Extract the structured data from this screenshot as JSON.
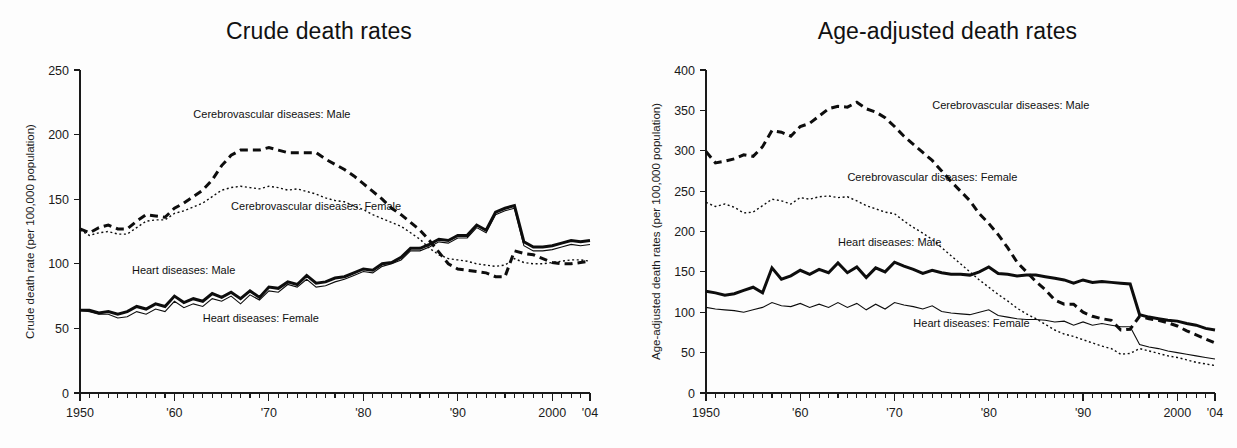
{
  "figure": {
    "background": "#fdfdfd",
    "ink_color": "#0d0d0d"
  },
  "panels": [
    {
      "id": "crude",
      "title": "Crude death rates",
      "ylabel": "Crude death rate (per 100,000 population)",
      "xlabel": "",
      "annotations": [
        {
          "text": "Cerebrovascular diseases: Male",
          "x_year": 1962.0,
          "y_value": 213
        },
        {
          "text": "Cerebrovascular diseases: Female",
          "x_year": 1966.0,
          "y_value": 142
        },
        {
          "text": "Heart diseases: Male",
          "x_year": 1955.5,
          "y_value": 92
        },
        {
          "text": "Heart diseases: Female",
          "x_year": 1963.0,
          "y_value": 55
        }
      ]
    },
    {
      "id": "age-adjusted",
      "title": "Age-adjusted death rates",
      "ylabel": "Age-adjusted death rates (per 100,000 population)",
      "xlabel": "",
      "annotations": [
        {
          "text": "Cerebrovascular diseases: Male",
          "x_year": 1974.0,
          "y_value": 352
        },
        {
          "text": "Cerebrovascular diseases: Female",
          "x_year": 1965.0,
          "y_value": 263
        },
        {
          "text": "Heart diseases: Male",
          "x_year": 1964.0,
          "y_value": 182
        },
        {
          "text": "Heart diseases: Female",
          "x_year": 1972.0,
          "y_value": 82
        }
      ]
    }
  ],
  "chart_data": [
    {
      "type": "line",
      "title": "Crude death rates",
      "xlabel": "",
      "ylabel": "Crude death rate (per 100,000 population)",
      "xlim": [
        1950,
        2004
      ],
      "ylim": [
        0,
        250
      ],
      "ytick_labels": [
        "0",
        "50",
        "100",
        "150",
        "200",
        "250"
      ],
      "yticks": [
        0,
        50,
        100,
        150,
        200,
        250
      ],
      "xticks": [
        1950,
        1960,
        1970,
        1980,
        1990,
        2000,
        2004
      ],
      "xtick_labels": [
        "1950",
        "'60",
        "'70",
        "'80",
        "'90",
        "2000",
        "'04"
      ],
      "minor_xtick_interval": 1,
      "grid": false,
      "legend_position": "inline-annotations",
      "x": [
        1950,
        1951,
        1952,
        1953,
        1954,
        1955,
        1956,
        1957,
        1958,
        1959,
        1960,
        1961,
        1962,
        1963,
        1964,
        1965,
        1966,
        1967,
        1968,
        1969,
        1970,
        1971,
        1972,
        1973,
        1974,
        1975,
        1976,
        1977,
        1978,
        1979,
        1980,
        1981,
        1982,
        1983,
        1984,
        1985,
        1986,
        1987,
        1988,
        1989,
        1990,
        1991,
        1992,
        1993,
        1994,
        1995,
        1996,
        1997,
        1998,
        1999,
        2000,
        2001,
        2002,
        2003,
        2004
      ],
      "series": [
        {
          "name": "Cerebrovascular diseases: Male",
          "style": "thick-dashed",
          "values": [
            127,
            124,
            128,
            130,
            127,
            127,
            133,
            138,
            137,
            136,
            143,
            147,
            152,
            157,
            165,
            176,
            184,
            188,
            188,
            188,
            190,
            188,
            186,
            186,
            186,
            186,
            181,
            177,
            173,
            168,
            162,
            156,
            150,
            143,
            138,
            132,
            126,
            118,
            109,
            100,
            96,
            95,
            94,
            93,
            90,
            90,
            110,
            108,
            107,
            104,
            101,
            100,
            100,
            101,
            102
          ]
        },
        {
          "name": "Cerebrovascular diseases: Female",
          "style": "thin-dotted",
          "values": [
            126,
            122,
            124,
            125,
            123,
            123,
            128,
            133,
            134,
            134,
            139,
            141,
            144,
            147,
            152,
            157,
            159,
            160,
            159,
            158,
            160,
            159,
            157,
            158,
            156,
            154,
            151,
            149,
            148,
            145,
            142,
            138,
            135,
            132,
            129,
            124,
            119,
            112,
            107,
            104,
            103,
            102,
            100,
            99,
            98,
            99,
            104,
            101,
            100,
            100,
            101,
            102,
            103,
            103,
            102
          ]
        },
        {
          "name": "Heart diseases: Male",
          "style": "thick-solid",
          "values": [
            64,
            64,
            62,
            63,
            61,
            63,
            67,
            65,
            69,
            67,
            75,
            70,
            73,
            71,
            77,
            74,
            78,
            73,
            79,
            74,
            82,
            81,
            86,
            84,
            91,
            85,
            86,
            89,
            90,
            93,
            96,
            95,
            100,
            101,
            105,
            112,
            112,
            115,
            119,
            118,
            122,
            122,
            130,
            126,
            140,
            143,
            145,
            117,
            113,
            113,
            114,
            116,
            118,
            117,
            118
          ]
        },
        {
          "name": "Heart diseases: Female",
          "style": "thin-solid",
          "values": [
            64,
            63,
            61,
            61,
            58,
            59,
            63,
            61,
            65,
            63,
            71,
            66,
            69,
            67,
            73,
            71,
            75,
            69,
            76,
            72,
            79,
            78,
            84,
            82,
            88,
            82,
            83,
            86,
            88,
            91,
            94,
            93,
            98,
            100,
            103,
            110,
            110,
            113,
            117,
            116,
            120,
            120,
            128,
            124,
            138,
            141,
            143,
            114,
            110,
            110,
            111,
            113,
            115,
            114,
            115
          ]
        }
      ]
    },
    {
      "type": "line",
      "title": "Age-adjusted death rates",
      "xlabel": "",
      "ylabel": "Age-adjusted death rates (per 100,000 population)",
      "xlim": [
        1950,
        2004
      ],
      "ylim": [
        0,
        400
      ],
      "ytick_labels": [
        "0",
        "50",
        "100",
        "150",
        "200",
        "250",
        "300",
        "350",
        "400"
      ],
      "yticks": [
        0,
        50,
        100,
        150,
        200,
        250,
        300,
        350,
        400
      ],
      "xticks": [
        1950,
        1960,
        1970,
        1980,
        1990,
        2000,
        2004
      ],
      "xtick_labels": [
        "1950",
        "'60",
        "'70",
        "'80",
        "'90",
        "2000",
        "'04"
      ],
      "minor_xtick_interval": 1,
      "grid": false,
      "legend_position": "inline-annotations",
      "x": [
        1950,
        1951,
        1952,
        1953,
        1954,
        1955,
        1956,
        1957,
        1958,
        1959,
        1960,
        1961,
        1962,
        1963,
        1964,
        1965,
        1966,
        1967,
        1968,
        1969,
        1970,
        1971,
        1972,
        1973,
        1974,
        1975,
        1976,
        1977,
        1978,
        1979,
        1980,
        1981,
        1982,
        1983,
        1984,
        1985,
        1986,
        1987,
        1988,
        1989,
        1990,
        1991,
        1992,
        1993,
        1994,
        1995,
        1996,
        1997,
        1998,
        1999,
        2000,
        2001,
        2002,
        2003,
        2004
      ],
      "series": [
        {
          "name": "Cerebrovascular diseases: Male",
          "style": "thick-dashed",
          "values": [
            299,
            285,
            287,
            290,
            295,
            293,
            305,
            325,
            323,
            318,
            330,
            334,
            343,
            352,
            355,
            354,
            360,
            352,
            348,
            341,
            330,
            318,
            308,
            298,
            288,
            275,
            262,
            250,
            238,
            222,
            210,
            196,
            180,
            162,
            150,
            138,
            128,
            115,
            110,
            110,
            100,
            95,
            92,
            90,
            78,
            79,
            95,
            92,
            90,
            87,
            83,
            77,
            72,
            67,
            62
          ]
        },
        {
          "name": "Cerebrovascular diseases: Female",
          "style": "thin-dotted",
          "values": [
            236,
            231,
            234,
            230,
            223,
            224,
            232,
            240,
            238,
            234,
            242,
            240,
            243,
            244,
            242,
            243,
            238,
            232,
            228,
            224,
            222,
            213,
            205,
            198,
            190,
            180,
            170,
            160,
            150,
            140,
            131,
            122,
            114,
            105,
            98,
            92,
            85,
            78,
            73,
            70,
            66,
            62,
            58,
            55,
            48,
            49,
            55,
            52,
            49,
            46,
            44,
            41,
            38,
            36,
            34
          ]
        },
        {
          "name": "Heart diseases: Male",
          "style": "thick-solid",
          "values": [
            126,
            124,
            121,
            123,
            127,
            131,
            124,
            155,
            141,
            145,
            152,
            147,
            153,
            149,
            161,
            149,
            156,
            143,
            155,
            150,
            162,
            157,
            153,
            148,
            152,
            149,
            147,
            147,
            146,
            150,
            156,
            148,
            147,
            145,
            146,
            146,
            144,
            142,
            140,
            136,
            140,
            137,
            138,
            137,
            136,
            135,
            97,
            94,
            92,
            90,
            89,
            86,
            84,
            80,
            78
          ]
        },
        {
          "name": "Heart diseases: Female",
          "style": "thin-solid",
          "values": [
            106,
            104,
            103,
            102,
            100,
            103,
            106,
            112,
            108,
            107,
            111,
            106,
            110,
            106,
            112,
            106,
            111,
            103,
            110,
            104,
            112,
            109,
            107,
            104,
            108,
            101,
            99,
            98,
            97,
            100,
            103,
            96,
            94,
            92,
            91,
            91,
            90,
            88,
            89,
            84,
            88,
            84,
            86,
            84,
            82,
            82,
            60,
            57,
            55,
            52,
            50,
            48,
            46,
            44,
            42
          ]
        }
      ]
    }
  ]
}
